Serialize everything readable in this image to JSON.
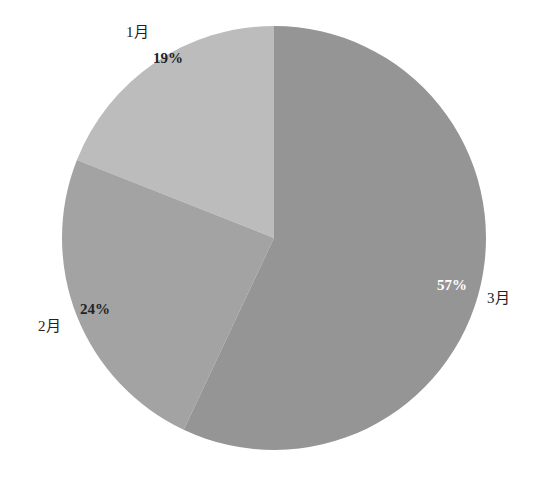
{
  "chart_data": {
    "type": "pie",
    "title": "",
    "categories": [
      "1月",
      "2月",
      "3月"
    ],
    "values": [
      19,
      24,
      57
    ],
    "labels": [
      "19%",
      "24%",
      "57%"
    ],
    "colors": [
      "#bcbcbc",
      "#a3a3a3",
      "#959595"
    ],
    "start_angle_deg": 0,
    "direction": "counterclockwise-from-top",
    "legend": "none (category labels outside slices)"
  },
  "slices": [
    {
      "category": "1月",
      "pct": "19%"
    },
    {
      "category": "2月",
      "pct": "24%"
    },
    {
      "category": "3月",
      "pct": "57%"
    }
  ]
}
